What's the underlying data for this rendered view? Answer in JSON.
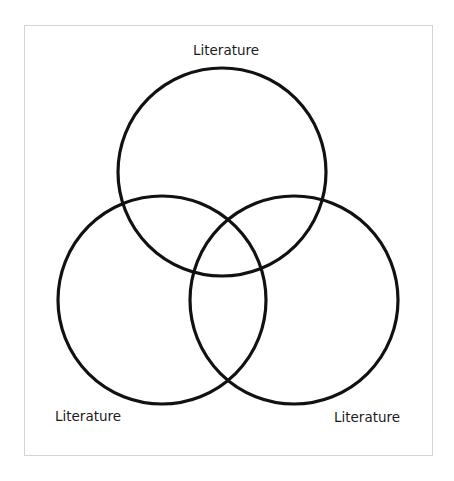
{
  "diagram": {
    "type": "venn",
    "stroke_color": "#111111",
    "frame_color": "#d4d4d4",
    "circles": [
      {
        "id": "top",
        "label": "Literature",
        "cx": 222,
        "cy": 172,
        "r": 104
      },
      {
        "id": "left",
        "label": "Literature",
        "cx": 162,
        "cy": 300,
        "r": 104
      },
      {
        "id": "right",
        "label": "Literature",
        "cx": 294,
        "cy": 300,
        "r": 104
      }
    ],
    "labels": {
      "top": "Literature",
      "left": "Literature",
      "right": "Literature"
    }
  }
}
